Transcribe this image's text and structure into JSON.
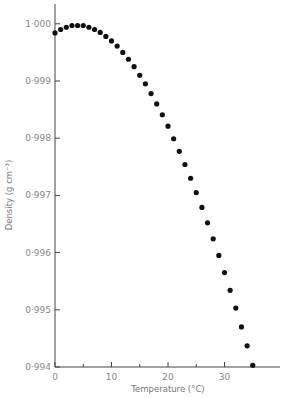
{
  "chart_data": {
    "type": "scatter",
    "title": "",
    "xlabel": "Temperature (°C)",
    "ylabel": "Density (g cm⁻³)",
    "xlim": [
      0,
      40
    ],
    "ylim": [
      0.994,
      1.0
    ],
    "xticks": [
      0,
      10,
      20,
      30
    ],
    "xminor": [
      5,
      15,
      25,
      35
    ],
    "yticks": [
      "1·000",
      "0·999",
      "0·998",
      "0·997",
      "0·996",
      "0·995",
      "0·994"
    ],
    "ytick_values": [
      1.0,
      0.999,
      0.998,
      0.997,
      0.996,
      0.995,
      0.994
    ],
    "grid": false,
    "x": [
      0,
      1,
      2,
      3,
      4,
      5,
      6,
      7,
      8,
      9,
      10,
      11,
      12,
      13,
      14,
      15,
      16,
      17,
      18,
      19,
      20,
      21,
      22,
      23,
      24,
      25,
      26,
      27,
      28,
      29,
      30,
      31,
      32,
      33,
      34,
      35
    ],
    "values": [
      0.99984,
      0.9999,
      0.99994,
      0.99997,
      0.99997,
      0.99997,
      0.99994,
      0.9999,
      0.99985,
      0.99978,
      0.9997,
      0.99961,
      0.9995,
      0.99938,
      0.99925,
      0.9991,
      0.99895,
      0.99878,
      0.9986,
      0.99841,
      0.99821,
      0.99799,
      0.99777,
      0.99754,
      0.9973,
      0.99705,
      0.99679,
      0.99652,
      0.99624,
      0.99595,
      0.99565,
      0.99534,
      0.99503,
      0.9947,
      0.99437,
      0.99403
    ]
  }
}
